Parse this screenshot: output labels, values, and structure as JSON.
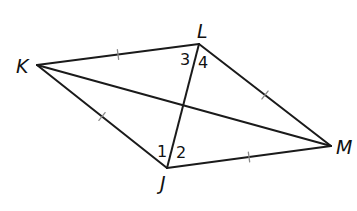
{
  "diagram": {
    "type": "quadrilateral-rhombus",
    "vertices": [
      {
        "id": "K",
        "label": "K",
        "x": 37,
        "y": 65,
        "label_x": 16,
        "label_y": 73
      },
      {
        "id": "L",
        "label": "L",
        "x": 199,
        "y": 44,
        "label_x": 197,
        "label_y": 38
      },
      {
        "id": "M",
        "label": "M",
        "x": 331,
        "y": 146,
        "label_x": 336,
        "label_y": 154
      },
      {
        "id": "J",
        "label": "J",
        "x": 167,
        "y": 168,
        "label_x": 160,
        "label_y": 190
      }
    ],
    "sides": [
      {
        "from": "K",
        "to": "L",
        "tick_marks": 1
      },
      {
        "from": "L",
        "to": "M",
        "tick_marks": 1
      },
      {
        "from": "M",
        "to": "J",
        "tick_marks": 1
      },
      {
        "from": "J",
        "to": "K",
        "tick_marks": 1
      }
    ],
    "diagonals": [
      {
        "from": "K",
        "to": "M"
      },
      {
        "from": "L",
        "to": "J"
      }
    ],
    "angle_labels": [
      {
        "label": "3",
        "x": 180,
        "y": 65
      },
      {
        "label": "4",
        "x": 198,
        "y": 68
      },
      {
        "label": "1",
        "x": 157,
        "y": 157
      },
      {
        "label": "2",
        "x": 176,
        "y": 158
      }
    ],
    "colors": {
      "stroke": "#1a1a1a",
      "tick": "#8a8a8a",
      "background": "#ffffff"
    }
  }
}
